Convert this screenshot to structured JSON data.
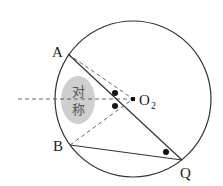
{
  "diagram": {
    "type": "geometry",
    "circle": {
      "center": [
        133,
        99
      ],
      "radius": 78
    },
    "points": {
      "A": {
        "label": "A",
        "x": 68,
        "y": 54
      },
      "B": {
        "label": "B",
        "x": 70,
        "y": 145
      },
      "Q": {
        "label": "Q",
        "x": 182,
        "y": 160
      },
      "O2": {
        "label": "O",
        "subscript": "2",
        "x": 133,
        "y": 99
      }
    },
    "segments_solid": [
      [
        "A",
        "Q"
      ],
      [
        "B",
        "Q"
      ]
    ],
    "segments_dashed": [
      [
        "A",
        "O2"
      ],
      [
        "B",
        "O2"
      ]
    ],
    "axis_dashed": {
      "from": [
        18,
        99
      ],
      "to": [
        133,
        99
      ]
    },
    "symmetry_badge": {
      "text_line1": "对",
      "text_line2": "称",
      "fill": "#cfcfcf"
    },
    "angle_marks": [
      {
        "x": 115,
        "y": 93
      },
      {
        "x": 115,
        "y": 106
      },
      {
        "x": 166,
        "y": 152
      }
    ],
    "colors": {
      "stroke": "#333333",
      "badge": "#cfcfcf",
      "background": "#ffffff"
    }
  }
}
